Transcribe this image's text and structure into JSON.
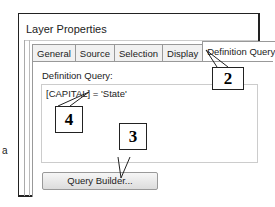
{
  "window": {
    "title": "Layer Properties"
  },
  "tabs": [
    {
      "label": "General",
      "active": false
    },
    {
      "label": "Source",
      "active": false
    },
    {
      "label": "Selection",
      "active": false
    },
    {
      "label": "Display",
      "active": false
    },
    {
      "label": "Definition Query",
      "active": true
    },
    {
      "label": "L",
      "active": false
    }
  ],
  "panel": {
    "label": "Definition Query:",
    "query_value": "[CAPITAL] = 'State'",
    "button_label": "Query Builder..."
  },
  "callouts": [
    {
      "number": "2"
    },
    {
      "number": "3"
    },
    {
      "number": "4"
    }
  ],
  "side_text": "a"
}
